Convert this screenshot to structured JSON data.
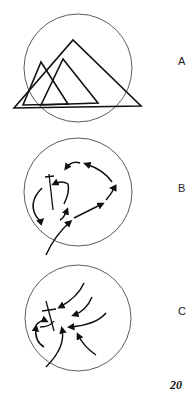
{
  "figures": [
    {
      "label": "A",
      "description": "Circle with overlapping triangles"
    },
    {
      "label": "B",
      "description": "Circle with looping arrow path around cross marker"
    },
    {
      "label": "C",
      "description": "Circle with converging arrows toward cross marker"
    }
  ],
  "page_number": "20"
}
